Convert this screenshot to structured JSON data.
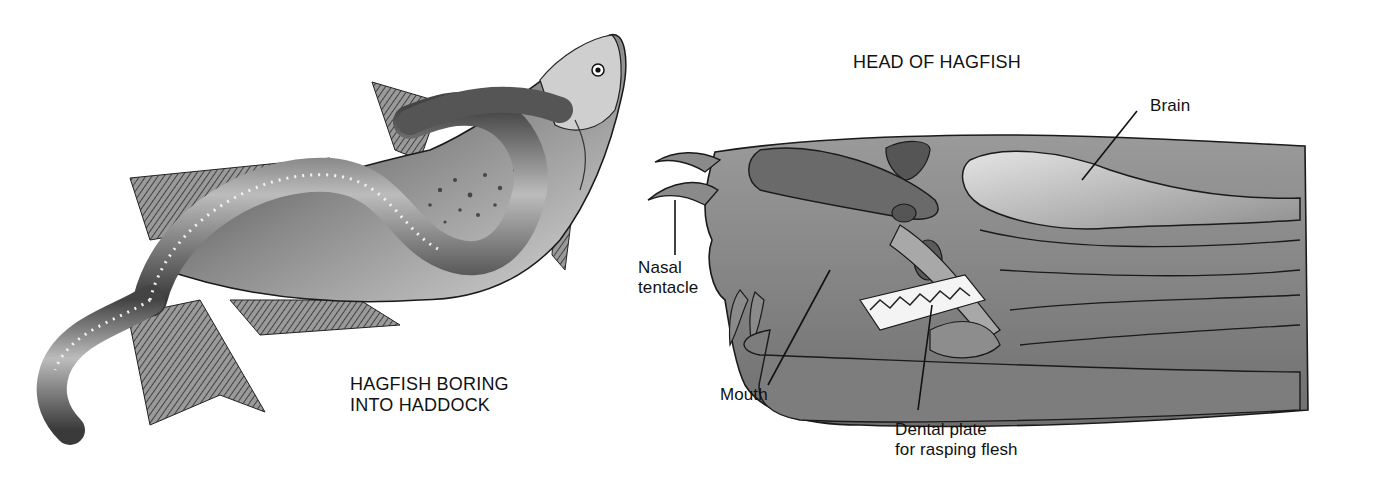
{
  "figures": [
    {
      "id": "hagfish-boring",
      "caption_lines": [
        "HAGFISH BORING",
        "INTO HADDOCK"
      ]
    },
    {
      "id": "head-of-hagfish",
      "title": "HEAD OF HAGFISH",
      "labels": {
        "brain": "Brain",
        "nasal_tentacle_1": "Nasal",
        "nasal_tentacle_2": "tentacle",
        "mouth": "Mouth",
        "dental_plate_1": "Dental plate",
        "dental_plate_2": "for rasping flesh"
      }
    }
  ],
  "colors": {
    "ink": "#111111",
    "dark": "#3a3a3a",
    "mid": "#7a7a7a",
    "light": "#b8b8b8",
    "pale": "#d9d9d9",
    "background": "#ffffff"
  }
}
